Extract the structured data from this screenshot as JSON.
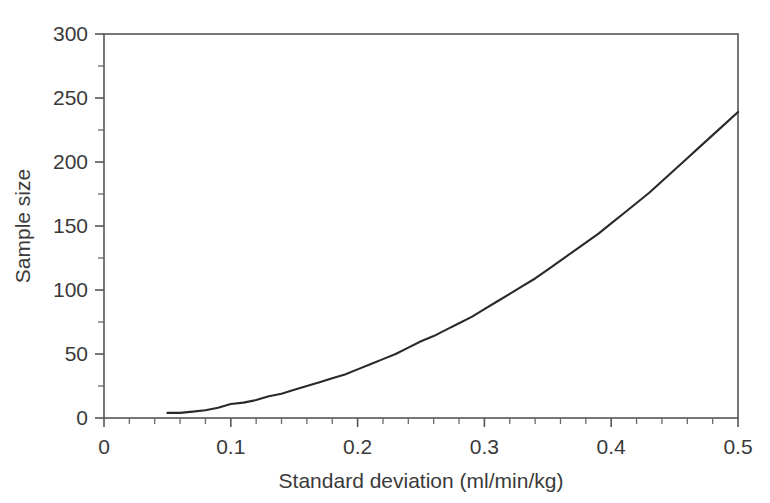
{
  "chart_data": {
    "type": "line",
    "title": "",
    "subtitle": "",
    "xlabel": "Standard deviation (ml/min/kg)",
    "ylabel": "Sample size",
    "xlim": [
      0,
      0.5
    ],
    "ylim": [
      0,
      300
    ],
    "grid": false,
    "legend": null,
    "legend_position": "none",
    "x_tick_labels": [
      "0",
      "0.1",
      "0.2",
      "0.3",
      "0.4",
      "0.5"
    ],
    "x_tick_values": [
      0,
      0.1,
      0.2,
      0.3,
      0.4,
      0.5
    ],
    "x_minor_tick_step": 0.02,
    "y_tick_labels": [
      "0",
      "50",
      "100",
      "150",
      "200",
      "250",
      "300"
    ],
    "y_tick_values": [
      0,
      50,
      100,
      150,
      200,
      250,
      300
    ],
    "y_minor_tick_step": 25,
    "line_color": "#2a2a2a",
    "frame_color": "#555555",
    "background_color": "#ffffff",
    "series": [
      {
        "name": "Sample size vs standard deviation",
        "x": [
          0.05,
          0.06,
          0.07,
          0.08,
          0.09,
          0.1,
          0.11,
          0.12,
          0.13,
          0.14,
          0.15,
          0.16,
          0.17,
          0.18,
          0.19,
          0.2,
          0.21,
          0.22,
          0.23,
          0.24,
          0.25,
          0.26,
          0.27,
          0.28,
          0.29,
          0.3,
          0.31,
          0.32,
          0.33,
          0.34,
          0.35,
          0.36,
          0.37,
          0.38,
          0.39,
          0.4,
          0.41,
          0.42,
          0.43,
          0.44,
          0.45,
          0.46,
          0.47,
          0.48,
          0.49,
          0.5
        ],
        "values": [
          4,
          4,
          5,
          6,
          8,
          11,
          12,
          14,
          17,
          19,
          22,
          25,
          28,
          31,
          34,
          38,
          42,
          46,
          50,
          55,
          60,
          64,
          69,
          74,
          79,
          85,
          91,
          97,
          103,
          109,
          116,
          123,
          130,
          137,
          144,
          152,
          160,
          168,
          176,
          185,
          194,
          203,
          212,
          221,
          230,
          239
        ]
      }
    ],
    "annotations": []
  }
}
